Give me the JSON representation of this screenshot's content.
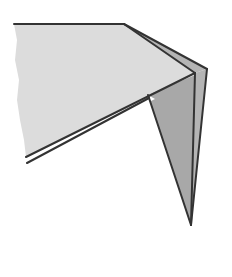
{
  "diagram": {
    "type": "origami-fold-illustration",
    "colors": {
      "background": "#ffffff",
      "paper_face": "#dcdcdc",
      "paper_edge_strip": "#b4b4b4",
      "flap_shadow": "#a8a8a8",
      "outline": "#333333"
    },
    "shapes": {
      "main_face": "M14,24 L124,24 L195,73 L26,157 L24,140 L20,120 L17,100 L19,80 L15,60 L17,40 Z",
      "top_strip": "M124,24 L207,69 L195,73 Z",
      "right_strip": "M195,73 L207,69 L191,225 Z",
      "hanging_flap": "M148,95 L195,75 L191,225 Z",
      "lower_edge_band": "M148,95 L155,99 L27,163 L26,157 Z"
    },
    "lines": [
      {
        "name": "top-edge",
        "x1": 14,
        "y1": 24,
        "x2": 124,
        "y2": 24
      },
      {
        "name": "top-slant-edge",
        "x1": 124,
        "y1": 24,
        "x2": 207,
        "y2": 69
      },
      {
        "name": "inner-slant-edge",
        "x1": 124,
        "y1": 24,
        "x2": 195,
        "y2": 73
      },
      {
        "name": "fold-diagonal",
        "x1": 195,
        "y1": 73,
        "x2": 26,
        "y2": 157
      },
      {
        "name": "lower-parallel-edge",
        "x1": 149,
        "y1": 98,
        "x2": 27,
        "y2": 163
      },
      {
        "name": "flap-left-edge",
        "x1": 148,
        "y1": 95,
        "x2": 191,
        "y2": 225
      },
      {
        "name": "flap-inner-crease",
        "x1": 195,
        "y1": 73,
        "x2": 191,
        "y2": 225
      },
      {
        "name": "outer-right-edge",
        "x1": 207,
        "y1": 69,
        "x2": 191,
        "y2": 225
      }
    ]
  }
}
